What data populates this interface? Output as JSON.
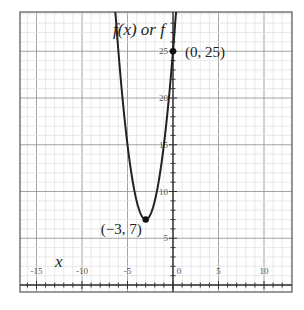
{
  "chart_data": {
    "type": "line",
    "title": "",
    "xlabel": "x",
    "ylabel": "f(x) or f",
    "function": "f(x) = 2(x + 3)^2 + 7",
    "xlim": [
      -17,
      13
    ],
    "ylim": [
      -0.8,
      29.2
    ],
    "x_ticks": [
      -15,
      -10,
      -5,
      0,
      5,
      10
    ],
    "x_tick_labels": [
      "-15",
      "-10",
      "-5",
      "0",
      "5",
      "10"
    ],
    "y_ticks": [
      5,
      10,
      15,
      20,
      25
    ],
    "y_tick_labels": [
      "5",
      "10",
      "15",
      "20",
      "25"
    ],
    "grid": {
      "minor": 1,
      "major": 5,
      "on": true
    },
    "series": [
      {
        "name": "f(x)",
        "x": [
          -6.3,
          -6,
          -5.5,
          -5,
          -4.5,
          -4,
          -3.5,
          -3,
          -2.5,
          -2,
          -1.5,
          -1,
          -0.5,
          0,
          0.3
        ],
        "values": [
          28.78,
          25,
          19.5,
          15,
          11.5,
          9,
          7.5,
          7,
          7.5,
          9,
          11.5,
          15,
          19.5,
          25,
          28.78
        ]
      }
    ],
    "points": [
      {
        "x": 0,
        "y": 25,
        "label": "(0, 25)"
      },
      {
        "x": -3,
        "y": 7,
        "label": "(−3, 7)"
      }
    ]
  },
  "labels": {
    "y_axis_title": "f(x) or f",
    "x_axis_title": "x",
    "point_intercept": "(0, 25)",
    "point_vertex": "(−3, 7)"
  }
}
